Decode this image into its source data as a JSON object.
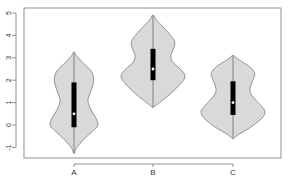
{
  "chart_data": {
    "type": "violin",
    "title": "",
    "xlabel": "",
    "ylabel": "",
    "categories": [
      "A",
      "B",
      "C"
    ],
    "ylim": [
      -1.5,
      5.2
    ],
    "yticks": [
      -1,
      0,
      1,
      2,
      3,
      4,
      5
    ],
    "ytick_labels": [
      "-1",
      "0",
      "1",
      "2",
      "3",
      "4",
      "5"
    ],
    "grid": false,
    "legend": "none",
    "fill_color": "#d9d9d9",
    "outline_color": "#888888",
    "box_color": "#000000",
    "median_color": "#ffffff",
    "series": [
      {
        "name": "A",
        "min": -1.25,
        "max": 3.25,
        "q1": -0.1,
        "median": 0.5,
        "q3": 1.9,
        "density": [
          [
            -1.25,
            0.02
          ],
          [
            -1.0,
            0.12
          ],
          [
            -0.6,
            0.45
          ],
          [
            -0.2,
            0.85
          ],
          [
            0.0,
            1.0
          ],
          [
            0.3,
            0.92
          ],
          [
            0.7,
            0.7
          ],
          [
            1.1,
            0.58
          ],
          [
            1.5,
            0.7
          ],
          [
            2.0,
            0.82
          ],
          [
            2.4,
            0.72
          ],
          [
            2.8,
            0.35
          ],
          [
            3.1,
            0.1
          ],
          [
            3.25,
            0.02
          ]
        ]
      },
      {
        "name": "B",
        "min": 0.8,
        "max": 4.9,
        "q1": 2.0,
        "median": 2.5,
        "q3": 3.4,
        "density": [
          [
            0.8,
            0.02
          ],
          [
            1.0,
            0.2
          ],
          [
            1.4,
            0.55
          ],
          [
            1.9,
            0.9
          ],
          [
            2.2,
            1.0
          ],
          [
            2.5,
            0.85
          ],
          [
            2.8,
            0.62
          ],
          [
            3.1,
            0.56
          ],
          [
            3.4,
            0.64
          ],
          [
            3.7,
            0.68
          ],
          [
            4.0,
            0.55
          ],
          [
            4.4,
            0.3
          ],
          [
            4.7,
            0.1
          ],
          [
            4.9,
            0.02
          ]
        ]
      },
      {
        "name": "C",
        "min": -0.6,
        "max": 3.1,
        "q1": 0.45,
        "median": 1.0,
        "q3": 1.95,
        "density": [
          [
            -0.6,
            0.02
          ],
          [
            -0.4,
            0.2
          ],
          [
            -0.1,
            0.55
          ],
          [
            0.3,
            0.9
          ],
          [
            0.6,
            1.0
          ],
          [
            0.9,
            0.85
          ],
          [
            1.3,
            0.6
          ],
          [
            1.6,
            0.53
          ],
          [
            2.0,
            0.62
          ],
          [
            2.3,
            0.68
          ],
          [
            2.6,
            0.52
          ],
          [
            2.9,
            0.2
          ],
          [
            3.1,
            0.02
          ]
        ]
      }
    ]
  }
}
